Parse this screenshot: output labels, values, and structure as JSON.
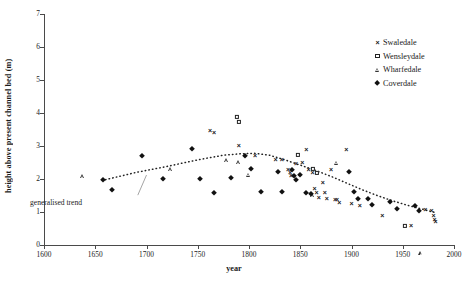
{
  "chart_data": {
    "type": "scatter",
    "title": "",
    "xlabel": "year",
    "ylabel": "height above present channel bed (m)",
    "xlim": [
      1600,
      2000
    ],
    "ylim": [
      0,
      7
    ],
    "xticks": [
      1600,
      1650,
      1700,
      1750,
      1800,
      1850,
      1900,
      1950,
      2000
    ],
    "yticks": [
      0,
      1,
      2,
      3,
      4,
      5,
      6,
      7
    ],
    "grid": false,
    "legend_position": "top-right",
    "annotations": [
      {
        "text": "generalised trend",
        "x": 1672,
        "y": 1.45,
        "points_to_x": 1700,
        "points_to_y": 2.12
      }
    ],
    "series": [
      {
        "name": "Swaledale",
        "marker": "x",
        "points": [
          [
            1762,
            3.48
          ],
          [
            1766,
            3.42
          ],
          [
            1790,
            3.02
          ],
          [
            1806,
            2.72
          ],
          [
            1826,
            2.62
          ],
          [
            1832,
            2.62
          ],
          [
            1838,
            2.3
          ],
          [
            1840,
            2.22
          ],
          [
            1841,
            2.12
          ],
          [
            1846,
            2.5
          ],
          [
            1852,
            2.52
          ],
          [
            1856,
            2.92
          ],
          [
            1858,
            2.3
          ],
          [
            1862,
            2.2
          ],
          [
            1864,
            1.72
          ],
          [
            1866,
            1.6
          ],
          [
            1868,
            1.45
          ],
          [
            1872,
            1.92
          ],
          [
            1874,
            1.62
          ],
          [
            1876,
            1.42
          ],
          [
            1880,
            2.3
          ],
          [
            1884,
            1.4
          ],
          [
            1886,
            1.38
          ],
          [
            1888,
            1.3
          ],
          [
            1895,
            2.9
          ],
          [
            1900,
            1.28
          ],
          [
            1908,
            1.22
          ],
          [
            1930,
            0.92
          ],
          [
            1958,
            0.62
          ],
          [
            1972,
            1.08
          ],
          [
            1978,
            1.05
          ],
          [
            1980,
            0.92
          ],
          [
            1981,
            0.8
          ],
          [
            1982,
            0.72
          ]
        ]
      },
      {
        "name": "Wensleydale",
        "marker": "square",
        "points": [
          [
            1788,
            3.88
          ],
          [
            1790,
            3.72
          ],
          [
            1848,
            2.72
          ],
          [
            1862,
            2.3
          ],
          [
            1866,
            2.18
          ],
          [
            1952,
            0.58
          ]
        ]
      },
      {
        "name": "Wharfedale",
        "marker": "triangle",
        "points": [
          [
            1638,
            2.08
          ],
          [
            1724,
            2.42
          ],
          [
            1778,
            2.82
          ],
          [
            1790,
            2.88
          ],
          [
            1800,
            2.62
          ],
          [
            1862,
            2.12
          ],
          [
            1886,
            3.22
          ],
          [
            1968,
            0.6
          ]
        ]
      },
      {
        "name": "Coverdale",
        "marker": "diamond",
        "points": [
          [
            1658,
            1.98
          ],
          [
            1666,
            1.68
          ],
          [
            1696,
            2.7
          ],
          [
            1716,
            2.0
          ],
          [
            1744,
            2.92
          ],
          [
            1752,
            2.0
          ],
          [
            1766,
            1.58
          ],
          [
            1782,
            2.02
          ],
          [
            1796,
            2.7
          ],
          [
            1802,
            2.3
          ],
          [
            1812,
            1.6
          ],
          [
            1828,
            2.22
          ],
          [
            1832,
            1.6
          ],
          [
            1842,
            2.28
          ],
          [
            1844,
            2.08
          ],
          [
            1846,
            1.98
          ],
          [
            1850,
            2.12
          ],
          [
            1856,
            1.58
          ],
          [
            1860,
            1.55
          ],
          [
            1898,
            2.22
          ],
          [
            1902,
            1.62
          ],
          [
            1906,
            1.4
          ],
          [
            1916,
            1.38
          ],
          [
            1920,
            1.22
          ],
          [
            1938,
            1.3
          ],
          [
            1944,
            1.1
          ],
          [
            1962,
            1.18
          ],
          [
            1966,
            1.02
          ]
        ]
      }
    ],
    "trend": {
      "name": "generalised trend",
      "style": "dotted",
      "points": [
        [
          1660,
          1.98
        ],
        [
          1690,
          2.2
        ],
        [
          1720,
          2.38
        ],
        [
          1750,
          2.58
        ],
        [
          1775,
          2.72
        ],
        [
          1790,
          2.76
        ],
        [
          1805,
          2.78
        ],
        [
          1820,
          2.72
        ],
        [
          1835,
          2.58
        ],
        [
          1850,
          2.42
        ],
        [
          1865,
          2.26
        ],
        [
          1880,
          2.08
        ],
        [
          1895,
          1.88
        ],
        [
          1910,
          1.68
        ],
        [
          1925,
          1.5
        ],
        [
          1940,
          1.34
        ],
        [
          1955,
          1.2
        ],
        [
          1970,
          1.08
        ],
        [
          1982,
          0.98
        ]
      ]
    }
  },
  "legend": {
    "items": [
      {
        "label": "Swaledale",
        "marker": "x"
      },
      {
        "label": "Wensleydale",
        "marker": "square"
      },
      {
        "label": "Wharfedale",
        "marker": "triangle"
      },
      {
        "label": "Coverdale",
        "marker": "diamond"
      }
    ]
  },
  "caption": ""
}
